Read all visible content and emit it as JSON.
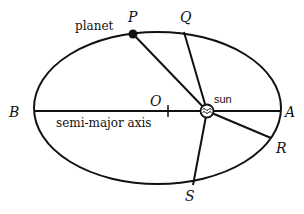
{
  "diagram": {
    "title": "",
    "colors": {
      "line": "#111111",
      "background": "#ffffff"
    },
    "labels": {
      "planet": "planet",
      "P": "P",
      "Q": "Q",
      "R": "R",
      "S": "S",
      "A": "A",
      "B": "B",
      "O": "O",
      "sun": "sun",
      "semi_major_axis": "semi-major axis"
    },
    "elements": {
      "orbit": "ellipse",
      "focus": "sun",
      "center": "O",
      "radius_lines": [
        "sun-P",
        "sun-Q",
        "sun-R",
        "sun-S"
      ],
      "axis": "B-A"
    }
  }
}
